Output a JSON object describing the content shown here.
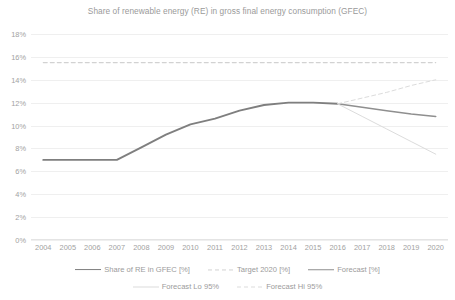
{
  "chart_data": {
    "type": "line",
    "title": "Share of renewable energy (RE) in gross final energy consumption (GFEC)",
    "xlabel": "",
    "ylabel": "",
    "x": [
      2004,
      2005,
      2006,
      2007,
      2008,
      2009,
      2010,
      2011,
      2012,
      2013,
      2014,
      2015,
      2016,
      2017,
      2018,
      2019,
      2020
    ],
    "categories": [
      "2004",
      "2005",
      "2006",
      "2007",
      "2008",
      "2009",
      "2010",
      "2011",
      "2012",
      "2013",
      "2014",
      "2015",
      "2016",
      "2017",
      "2018",
      "2019",
      "2020"
    ],
    "ylim": [
      0,
      18
    ],
    "ytick_values": [
      0,
      2,
      4,
      6,
      8,
      10,
      12,
      14,
      16,
      18
    ],
    "ytick_labels": [
      "0%",
      "2%",
      "4%",
      "6%",
      "8%",
      "10%",
      "12%",
      "14%",
      "16%",
      "18%"
    ],
    "grid": true,
    "legend_position": "bottom",
    "series": [
      {
        "name": "Share of RE in GFEC [%]",
        "style": "solid",
        "color": "#7f7f7f",
        "width": 1.9,
        "values": [
          7.0,
          7.0,
          7.0,
          7.0,
          8.1,
          9.2,
          10.1,
          10.6,
          11.3,
          11.8,
          12.0,
          12.0,
          11.9,
          null,
          null,
          null,
          null
        ]
      },
      {
        "name": "Target 2020 [%]",
        "style": "dashed",
        "color": "#d2d2d2",
        "width": 1.1,
        "values": [
          15.5,
          15.5,
          15.5,
          15.5,
          15.5,
          15.5,
          15.5,
          15.5,
          15.5,
          15.5,
          15.5,
          15.5,
          15.5,
          15.5,
          15.5,
          15.5,
          15.5
        ]
      },
      {
        "name": "Forecast [%]",
        "style": "solid",
        "color": "#8f8f8f",
        "width": 1.5,
        "values": [
          null,
          null,
          null,
          null,
          null,
          null,
          null,
          null,
          null,
          null,
          null,
          null,
          11.9,
          11.6,
          11.3,
          11.0,
          10.8
        ]
      },
      {
        "name": "Forecast Lo 95%",
        "style": "solid",
        "color": "#dcdcdc",
        "width": 1.0,
        "values": [
          null,
          null,
          null,
          null,
          null,
          null,
          null,
          null,
          null,
          null,
          null,
          null,
          11.9,
          10.8,
          9.7,
          8.6,
          7.5
        ]
      },
      {
        "name": "Forecast Hi 95%",
        "style": "dashed",
        "color": "#dcdcdc",
        "width": 1.0,
        "values": [
          null,
          null,
          null,
          null,
          null,
          null,
          null,
          null,
          null,
          null,
          null,
          null,
          11.9,
          12.4,
          12.9,
          13.5,
          14.0
        ]
      }
    ]
  },
  "legend": {
    "rows": [
      [
        {
          "label": "Share of RE in GFEC [%]",
          "series": 0
        },
        {
          "label": "Target 2020 [%]",
          "series": 1
        },
        {
          "label": "Forecast [%]",
          "series": 2
        }
      ],
      [
        {
          "label": "Forecast Lo 95%",
          "series": 3
        },
        {
          "label": "Forecast Hi 95%",
          "series": 4
        }
      ]
    ]
  }
}
